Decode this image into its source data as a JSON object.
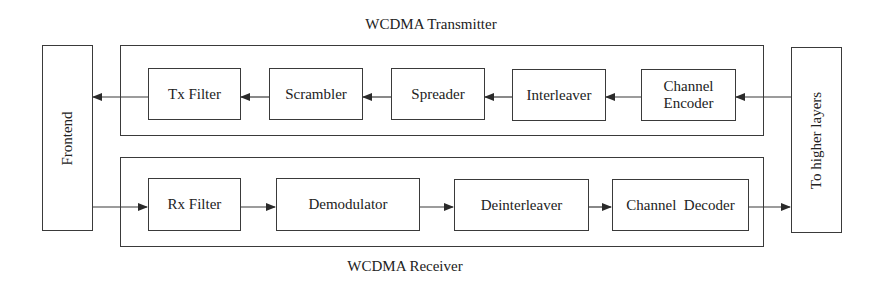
{
  "diagram": {
    "title_transmitter": "WCDMA Transmitter",
    "title_receiver": "WCDMA Receiver",
    "side_left": {
      "label": "Frontend"
    },
    "side_right": {
      "label": "To higher layers"
    },
    "transmitter": {
      "flow_direction": "right-to-left",
      "blocks": [
        {
          "label": "Tx Filter"
        },
        {
          "label": "Scrambler"
        },
        {
          "label": "Spreader"
        },
        {
          "label": "Interleaver"
        },
        {
          "label_line1": "Channel",
          "label_line2": "Encoder"
        }
      ]
    },
    "receiver": {
      "flow_direction": "left-to-right",
      "blocks": [
        {
          "label": "Rx Filter"
        },
        {
          "label": "Demodulator"
        },
        {
          "label": "Deinterleaver"
        },
        {
          "label": "Channel  Decoder"
        }
      ]
    },
    "colors": {
      "line": "#3a3a3a",
      "background": "#ffffff",
      "text": "#222222"
    }
  }
}
